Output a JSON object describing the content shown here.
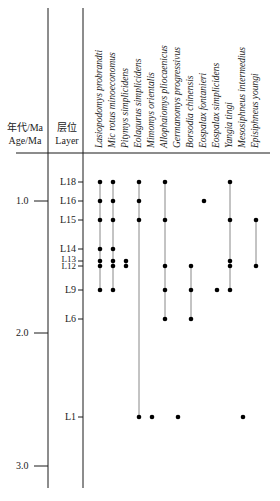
{
  "headers": {
    "age_cn": "年代/Ma",
    "age_en": "Age/Ma",
    "layer_cn": "层位",
    "layer_en": "Layer"
  },
  "colors": {
    "line": "#1a1a1a",
    "range": "#888888",
    "dot": "#000000"
  },
  "chart_data": {
    "type": "range-chart",
    "title": "",
    "xlabel": "",
    "ylabel": "Age/Ma",
    "age_ticks": [
      {
        "label": "1.0",
        "value": 1.0,
        "y": 201
      },
      {
        "label": "2.0",
        "value": 2.0,
        "y": 333
      },
      {
        "label": "3.0",
        "value": 3.0,
        "y": 466
      }
    ],
    "layers": [
      {
        "label": "L18",
        "y": 182
      },
      {
        "label": "L16",
        "y": 201
      },
      {
        "label": "L15",
        "y": 220
      },
      {
        "label": "L14",
        "y": 249
      },
      {
        "label": "L13",
        "y": 261
      },
      {
        "label": "L12",
        "y": 266
      },
      {
        "label": "L9",
        "y": 290
      },
      {
        "label": "L6",
        "y": 319
      },
      {
        "label": "L1",
        "y": 417
      }
    ],
    "species": [
      {
        "name": "Lasiopodomys probrandti",
        "x": 100,
        "occurrences": [
          "L18",
          "L16",
          "L15",
          "L14",
          "L13",
          "L12",
          "L9"
        ]
      },
      {
        "name": "Mic rotus minoeconomus",
        "x": 113,
        "occurrences": [
          "L18",
          "L16",
          "L15",
          "L14",
          "L13",
          "L12",
          "L9"
        ]
      },
      {
        "name": "Pitymys simplicidens",
        "x": 126,
        "occurrences": [
          "L13",
          "L12"
        ]
      },
      {
        "name": "Eolagurus simplicidens",
        "x": 139,
        "occurrences": [
          "L18",
          "L16",
          "L15",
          "L1"
        ]
      },
      {
        "name": "Mimomys orientalis",
        "x": 152,
        "occurrences": [
          "L1"
        ]
      },
      {
        "name": "Allophaiomys pliocaenicus",
        "x": 165,
        "occurrences": [
          "L18",
          "L15",
          "L12",
          "L9",
          "L6"
        ]
      },
      {
        "name": "Germanomys progressivus",
        "x": 178,
        "occurrences": [
          "L1"
        ]
      },
      {
        "name": "Borsodia chinensis",
        "x": 191,
        "occurrences": [
          "L12",
          "L9",
          "L6"
        ]
      },
      {
        "name": "Eospalax fontanieri",
        "x": 204,
        "occurrences": [
          "L16"
        ]
      },
      {
        "name": "Eospalax simplicidens",
        "x": 217,
        "occurrences": [
          "L9"
        ]
      },
      {
        "name": "Yangia tingi",
        "x": 230,
        "occurrences": [
          "L18",
          "L15",
          "L13",
          "L12",
          "L9"
        ]
      },
      {
        "name": "Mesosiphneus intermedius",
        "x": 243,
        "occurrences": [
          "L1"
        ]
      },
      {
        "name": "Episiphneus youngi",
        "x": 256,
        "occurrences": [
          "L15",
          "L12"
        ]
      }
    ]
  }
}
